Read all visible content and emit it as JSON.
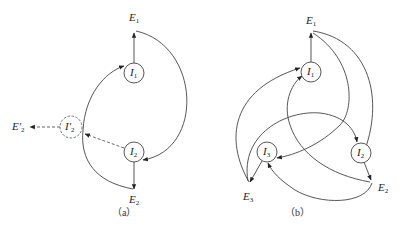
{
  "figure": {
    "panels": [
      {
        "id": "a",
        "caption": "（a）",
        "nodes": [
          {
            "id": "E1",
            "base": "E",
            "sub": "1",
            "type": "label",
            "x": 134,
            "y": 20
          },
          {
            "id": "I1",
            "base": "I",
            "sub": "1",
            "type": "circle",
            "x": 134,
            "y": 73
          },
          {
            "id": "I2",
            "base": "I",
            "sub": "2",
            "type": "circle",
            "x": 134,
            "y": 152
          },
          {
            "id": "E2",
            "base": "E",
            "sub": "2",
            "type": "label",
            "x": 134,
            "y": 201
          },
          {
            "id": "I'2",
            "base": "I'",
            "sub": "2",
            "type": "dashed-circle",
            "x": 71,
            "y": 127
          },
          {
            "id": "E'2",
            "base": "E'",
            "sub": "2",
            "type": "label",
            "x": 18,
            "y": 127
          }
        ],
        "edges": [
          {
            "from": "I1",
            "to": "E1",
            "style": "solid",
            "shape": "straight"
          },
          {
            "from": "E1",
            "to": "I2",
            "style": "solid",
            "shape": "curve"
          },
          {
            "from": "I2",
            "to": "E2",
            "style": "solid",
            "shape": "straight"
          },
          {
            "from": "E2",
            "to": "I1",
            "style": "solid",
            "shape": "curve",
            "via": "I'2"
          },
          {
            "from": "I2",
            "to": "I'2",
            "style": "dashed",
            "shape": "straight"
          },
          {
            "from": "I'2",
            "to": "E'2",
            "style": "dashed",
            "shape": "straight"
          }
        ]
      },
      {
        "id": "b",
        "caption": "（b）",
        "nodes": [
          {
            "id": "E1",
            "base": "E",
            "sub": "1",
            "type": "label",
            "x": 311,
            "y": 22
          },
          {
            "id": "I1",
            "base": "I",
            "sub": "1",
            "type": "circle",
            "x": 311,
            "y": 72
          },
          {
            "id": "I3",
            "base": "I",
            "sub": "3",
            "type": "circle",
            "x": 267,
            "y": 152
          },
          {
            "id": "I2",
            "base": "I",
            "sub": "2",
            "type": "circle",
            "x": 361,
            "y": 153
          },
          {
            "id": "E3",
            "base": "E",
            "sub": "3",
            "type": "label",
            "x": 248,
            "y": 204
          },
          {
            "id": "E2",
            "base": "E",
            "sub": "2",
            "type": "label",
            "x": 384,
            "y": 190
          }
        ],
        "edges": [
          {
            "from": "I1",
            "to": "E1",
            "style": "solid",
            "shape": "straight"
          },
          {
            "from": "E1",
            "to": "I2",
            "style": "solid",
            "shape": "curve"
          },
          {
            "from": "E1",
            "to": "I3",
            "style": "solid",
            "shape": "curve"
          },
          {
            "from": "I2",
            "to": "E2",
            "style": "solid",
            "shape": "straight"
          },
          {
            "from": "E2",
            "to": "I1",
            "style": "solid",
            "shape": "curve"
          },
          {
            "from": "E2",
            "to": "I3",
            "style": "solid",
            "shape": "curve"
          },
          {
            "from": "I3",
            "to": "E3",
            "style": "solid",
            "shape": "straight"
          },
          {
            "from": "E3",
            "to": "I1",
            "style": "solid",
            "shape": "curve"
          },
          {
            "from": "E3",
            "to": "I2",
            "style": "solid",
            "shape": "curve"
          }
        ]
      }
    ]
  },
  "colors": {
    "line": "#444444",
    "dashed": "#555555",
    "background": "#ffffff"
  }
}
